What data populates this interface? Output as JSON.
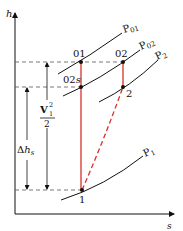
{
  "diagram": {
    "type": "h-s (Mollier) diagram",
    "axes": {
      "y_label": "h",
      "x_label": "s"
    },
    "isobars": [
      {
        "id": "p01",
        "label": "P",
        "sub": "01"
      },
      {
        "id": "p02",
        "label": "P",
        "sub": "02"
      },
      {
        "id": "p2",
        "label": "P",
        "sub": "2"
      },
      {
        "id": "p1",
        "label": "P",
        "sub": "1"
      }
    ],
    "points": [
      {
        "id": "01",
        "label": "01"
      },
      {
        "id": "02",
        "label": "02"
      },
      {
        "id": "02s",
        "label": "02",
        "suffix": "s"
      },
      {
        "id": "2",
        "label": "2"
      },
      {
        "id": "1",
        "label": "1"
      }
    ],
    "annotations": {
      "kinetic": {
        "numerator": "V",
        "sup": "2",
        "sub": "1",
        "denominator": "2"
      },
      "delta_h": {
        "delta": "Δ",
        "h": "h",
        "sub": "s"
      }
    },
    "colors": {
      "process_line": "#d9302a",
      "curve": "#111111",
      "dashed": "#555555"
    }
  }
}
